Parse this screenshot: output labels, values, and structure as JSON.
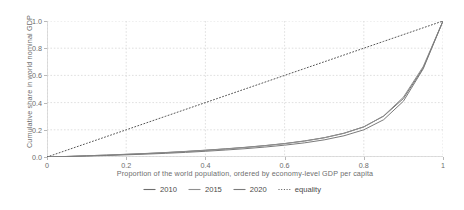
{
  "chart_data": {
    "type": "line",
    "title": "",
    "subtitle": "",
    "xlabel": "Proportion of the world population, ordered by economy-level GDP per capita",
    "ylabel": "Cumulative share in world nominal GDP",
    "xlim": [
      0,
      1
    ],
    "ylim": [
      0,
      1
    ],
    "xticks": [
      0,
      0.2,
      0.4,
      0.6,
      0.8,
      1
    ],
    "xticklabels": [
      "0",
      "0.2",
      "0.4",
      "0.6",
      "0.8",
      "1"
    ],
    "yticks": [
      0,
      0.2,
      0.4,
      0.6,
      0.8,
      1
    ],
    "yticklabels": [
      "0.0",
      "0.2",
      "0.4",
      "0.6",
      "0.8",
      "1.0"
    ],
    "grid": true,
    "grid_style": "dotted",
    "grid_color": "#d8d8d8",
    "legend_position": "bottom-center",
    "annotations": [],
    "x": [
      0,
      0.05,
      0.1,
      0.15,
      0.2,
      0.25,
      0.3,
      0.35,
      0.4,
      0.45,
      0.5,
      0.55,
      0.6,
      0.65,
      0.7,
      0.75,
      0.8,
      0.85,
      0.9,
      0.95,
      1
    ],
    "series": [
      {
        "name": "2010",
        "color": "#6e6e6e",
        "style": "solid",
        "values": [
          0,
          0.004,
          0.009,
          0.014,
          0.02,
          0.026,
          0.033,
          0.041,
          0.05,
          0.06,
          0.071,
          0.084,
          0.099,
          0.118,
          0.142,
          0.175,
          0.222,
          0.3,
          0.43,
          0.655,
          1
        ]
      },
      {
        "name": "2015",
        "color": "#8f8f8f",
        "style": "solid",
        "values": [
          0,
          0.004,
          0.009,
          0.014,
          0.019,
          0.025,
          0.032,
          0.04,
          0.049,
          0.059,
          0.07,
          0.083,
          0.098,
          0.117,
          0.141,
          0.174,
          0.221,
          0.302,
          0.44,
          0.665,
          1
        ]
      },
      {
        "name": "2020",
        "color": "#7b7b7b",
        "style": "solid",
        "values": [
          0,
          0.003,
          0.007,
          0.011,
          0.016,
          0.021,
          0.027,
          0.034,
          0.042,
          0.051,
          0.061,
          0.073,
          0.087,
          0.104,
          0.126,
          0.156,
          0.2,
          0.274,
          0.41,
          0.648,
          1
        ]
      },
      {
        "name": "equality",
        "color": "#555555",
        "style": "dotted",
        "values": [
          0,
          0.05,
          0.1,
          0.15,
          0.2,
          0.25,
          0.3,
          0.35,
          0.4,
          0.45,
          0.5,
          0.55,
          0.6,
          0.65,
          0.7,
          0.75,
          0.8,
          0.85,
          0.9,
          0.95,
          1
        ]
      }
    ]
  },
  "legend": {
    "items": [
      {
        "label": "2010",
        "color": "#6e6e6e",
        "style": "solid"
      },
      {
        "label": "2015",
        "color": "#8f8f8f",
        "style": "solid"
      },
      {
        "label": "2020",
        "color": "#7b7b7b",
        "style": "solid"
      },
      {
        "label": "equality",
        "color": "#555555",
        "style": "dotted"
      }
    ]
  }
}
